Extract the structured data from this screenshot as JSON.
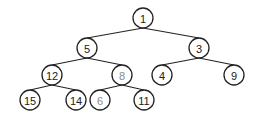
{
  "diagram": {
    "type": "binary-tree",
    "colors": {
      "edge": "#222222",
      "node_border": "#222222",
      "label": "#222222",
      "label_muted": "#8a8a8a",
      "background": "#ffffff"
    },
    "node_radius": 10,
    "nodes": [
      {
        "id": "n1",
        "label": "1",
        "x": 143,
        "y": 18,
        "muted": false
      },
      {
        "id": "n5",
        "label": "5",
        "x": 87,
        "y": 48,
        "muted": false
      },
      {
        "id": "n3",
        "label": "3",
        "x": 199,
        "y": 48,
        "muted": false
      },
      {
        "id": "n12",
        "label": "12",
        "x": 52,
        "y": 75,
        "muted": false
      },
      {
        "id": "n8",
        "label": "8",
        "x": 122,
        "y": 75,
        "muted": true
      },
      {
        "id": "n4",
        "label": "4",
        "x": 162,
        "y": 75,
        "muted": false
      },
      {
        "id": "n9",
        "label": "9",
        "x": 234,
        "y": 75,
        "muted": false
      },
      {
        "id": "n15",
        "label": "15",
        "x": 30,
        "y": 100,
        "muted": false
      },
      {
        "id": "n14",
        "label": "14",
        "x": 76,
        "y": 100,
        "muted": false
      },
      {
        "id": "n6",
        "label": "6",
        "x": 100,
        "y": 100,
        "muted": true
      },
      {
        "id": "n11",
        "label": "11",
        "x": 144,
        "y": 100,
        "muted": false
      }
    ],
    "edges": [
      {
        "from": "n1",
        "to": "n5"
      },
      {
        "from": "n1",
        "to": "n3"
      },
      {
        "from": "n5",
        "to": "n12"
      },
      {
        "from": "n5",
        "to": "n8"
      },
      {
        "from": "n3",
        "to": "n4"
      },
      {
        "from": "n3",
        "to": "n9"
      },
      {
        "from": "n12",
        "to": "n15"
      },
      {
        "from": "n12",
        "to": "n14"
      },
      {
        "from": "n8",
        "to": "n6"
      },
      {
        "from": "n8",
        "to": "n11"
      }
    ]
  }
}
